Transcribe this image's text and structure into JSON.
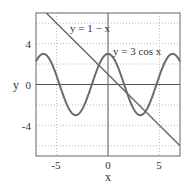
{
  "chart_data": {
    "type": "line",
    "title": "",
    "xlabel": "x",
    "ylabel": "y",
    "xlim": [
      -7,
      7
    ],
    "ylim": [
      -7,
      7
    ],
    "x_ticks": [
      "-5",
      "0",
      "5"
    ],
    "y_ticks": [
      "4",
      "0",
      "-4"
    ],
    "grid": true,
    "series": [
      {
        "name": "y = 1 − x",
        "label": "y = 1 − x",
        "function": "1 - x",
        "x": [
          -7,
          7
        ],
        "values": [
          8,
          -6
        ]
      },
      {
        "name": "y = 3 cos x",
        "label": "y = 3 cos x",
        "function": "3*cos(x)",
        "amplitude": 3
      }
    ],
    "colors": {
      "curve": "#6b6b6b",
      "axis": "#555555",
      "grid": "#bbbbbb"
    }
  }
}
